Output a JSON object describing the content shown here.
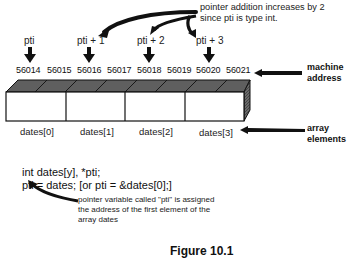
{
  "annotation_top": {
    "line1": "pointer addition increases by 2",
    "line2": "since pti is type int."
  },
  "pointers": [
    {
      "label": "pti",
      "target_address": "56014"
    },
    {
      "label": "pti + 1",
      "target_address": "56016"
    },
    {
      "label": "pti + 2",
      "target_address": "56018"
    },
    {
      "label": "pti + 3",
      "target_address": "56020"
    }
  ],
  "addresses": [
    "56014",
    "56015",
    "56016",
    "56017",
    "56018",
    "56019",
    "56020",
    "56021"
  ],
  "labels": {
    "machine_address_line1": "machine",
    "machine_address_line2": "address",
    "array_elements_line1": "array",
    "array_elements_line2": "elements"
  },
  "elements": [
    "dates[0]",
    "dates[1]",
    "dates[2]",
    "dates[3]"
  ],
  "code": {
    "line1": "int dates[y], *pti;",
    "line2": "pti = dates; [or pti = &dates[0];]"
  },
  "annotation_bottom": {
    "line1": "pointer variable called \"pti\" is assigned",
    "line2": "the address of the first element of the",
    "line3": "array dates"
  },
  "caption": "Figure 10.1",
  "colors": {
    "box_top": "#5a5a5a",
    "box_side": "#3a3a3a",
    "ink": "#111111"
  }
}
